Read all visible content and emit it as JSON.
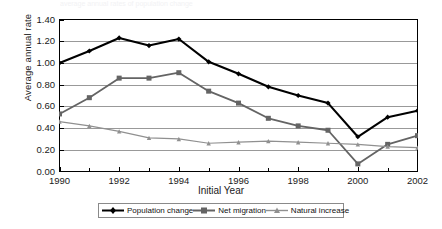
{
  "figure": {
    "top_text_fragment": "average annual rates of population change",
    "background_color": "#ffffff"
  },
  "axes": {
    "ylabel": "Average annual rate",
    "xlabel": "Initial Year",
    "yticks": [
      "0.00",
      "0.20",
      "0.40",
      "0.60",
      "0.80",
      "1.00",
      "1.20",
      "1.40"
    ],
    "xticks": [
      "1990",
      "1992",
      "1994",
      "1996",
      "1998",
      "2000",
      "2002"
    ],
    "axis_color": "#000000",
    "grid_color": "#999999"
  },
  "legend": {
    "position": "below-axis",
    "border_color": "#8a8a8a",
    "entries": [
      {
        "label": "Population change",
        "color": "#000000",
        "marker": "diamond-marker"
      },
      {
        "label": "Net migration",
        "color": "#646464",
        "marker": "square-marker"
      },
      {
        "label": "Natural increase",
        "color": "#909090",
        "marker": "triangle-marker"
      }
    ]
  },
  "chart_data": {
    "type": "line",
    "title": "",
    "xlabel": "Initial Year",
    "ylabel": "Average annual rate",
    "x": [
      1990,
      1991,
      1992,
      1993,
      1994,
      1995,
      1996,
      1997,
      1998,
      1999,
      2000,
      2001,
      2002
    ],
    "xlim": [
      1990,
      2002
    ],
    "ylim": [
      0.0,
      1.4
    ],
    "ytick_step": 0.2,
    "xtick_step": 2,
    "grid": "horizontal",
    "legend_position": "bottom",
    "series": [
      {
        "name": "Population change",
        "color": "#000000",
        "marker": "diamond",
        "values": [
          1.0,
          1.11,
          1.23,
          1.16,
          1.22,
          1.01,
          0.9,
          0.78,
          0.7,
          0.63,
          0.32,
          0.5,
          0.56
        ]
      },
      {
        "name": "Net migration",
        "color": "#646464",
        "marker": "square",
        "values": [
          0.53,
          0.68,
          0.86,
          0.86,
          0.91,
          0.74,
          0.63,
          0.49,
          0.42,
          0.38,
          0.07,
          0.25,
          0.33
        ]
      },
      {
        "name": "Natural increase",
        "color": "#909090",
        "marker": "triangle",
        "values": [
          0.46,
          0.42,
          0.37,
          0.31,
          0.3,
          0.26,
          0.27,
          0.28,
          0.27,
          0.26,
          0.25,
          0.23,
          0.22
        ]
      }
    ]
  }
}
